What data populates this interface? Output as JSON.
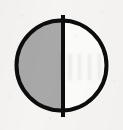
{
  "image": {
    "kind": "scanned-symbol-glyph",
    "description": "Circle divided by a vertical line, left half filled gray, right half empty",
    "width": 123,
    "height": 130,
    "background_color": "#f5f4f2"
  },
  "symbol": {
    "name": "half-filled-circle",
    "outline_color": "#0d0d0d",
    "outline_width": 4,
    "center_x": 61.5,
    "center_y": 65.5,
    "radius": 47,
    "halves": [
      {
        "name": "left-half",
        "side": "left",
        "state": "filled",
        "fill_color": "#a8a8a8"
      },
      {
        "name": "right-half",
        "side": "right",
        "state": "empty",
        "fill_color": "#fbfbfa"
      }
    ],
    "divider": {
      "name": "vertical-divider",
      "orientation": "vertical",
      "color": "#0d0d0d",
      "width": 4,
      "x": 63,
      "y_top": 13,
      "y_bottom": 119
    }
  }
}
